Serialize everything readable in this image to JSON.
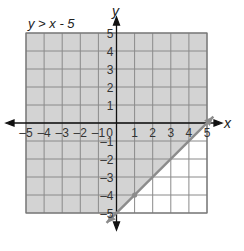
{
  "chart_data": {
    "type": "line",
    "title": "y > x - 5",
    "xlabel": "x",
    "ylabel": "y",
    "xlim": [
      -5,
      5
    ],
    "ylim": [
      -5,
      5
    ],
    "grid": true,
    "x_ticks": [
      "-5",
      "-4",
      "-3",
      "-2",
      "-1",
      "0",
      "1",
      "2",
      "3",
      "4",
      "5"
    ],
    "y_ticks": [
      "5",
      "4",
      "3",
      "2",
      "1",
      "-1",
      "-2",
      "-3",
      "-4",
      "-5"
    ],
    "boundary_line": {
      "equation": "y = x - 5",
      "style": "solid",
      "points": [
        [
          0,
          -5
        ],
        [
          1,
          -4
        ],
        [
          5,
          0
        ]
      ],
      "marked_point": [
        1,
        -4
      ]
    },
    "shaded_region": "above line (y > x - 5)",
    "colors": {
      "shade": "#d3d3d3",
      "grid": "#8a8a8a",
      "line": "#8c8c8c",
      "axis": "#111111"
    }
  }
}
